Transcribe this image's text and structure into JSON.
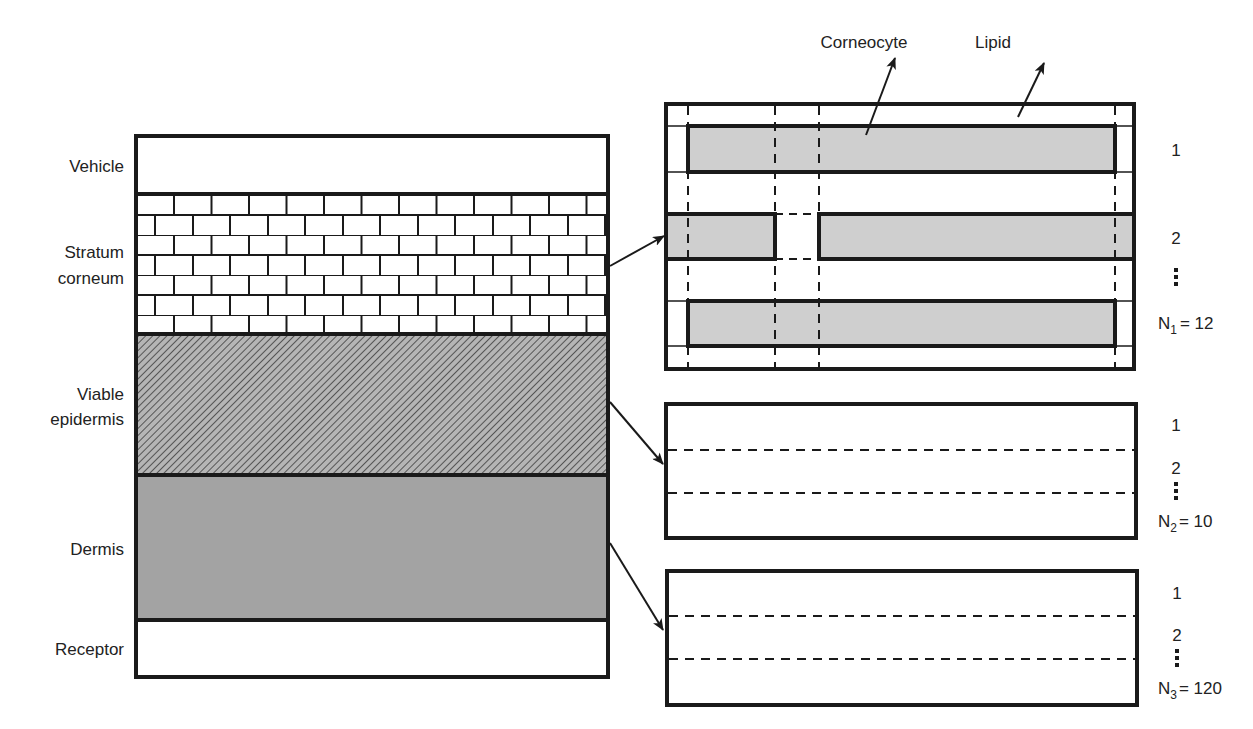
{
  "figure": {
    "type": "skin-layer-compartment-model",
    "colors": {
      "stroke": "#1a1a1a",
      "corneocyte_fill": "#cfcfcf",
      "viable_epidermis_fill": "#9a9a9a",
      "dermis_fill": "#a3a3a3",
      "background": "#ffffff"
    }
  },
  "left_stack": {
    "layers": [
      {
        "id": "vehicle",
        "label_lines": [
          "Vehicle"
        ],
        "pattern": "blank"
      },
      {
        "id": "stratum-corneum",
        "label_lines": [
          "Stratum",
          "corneum"
        ],
        "pattern": "brick"
      },
      {
        "id": "viable-epidermis",
        "label_lines": [
          "Viable",
          "epidermis"
        ],
        "pattern": "diagonal-hatch"
      },
      {
        "id": "dermis",
        "label_lines": [
          "Dermis"
        ],
        "pattern": "solid-gray"
      },
      {
        "id": "receptor",
        "label_lines": [
          "Receptor"
        ],
        "pattern": "blank"
      }
    ]
  },
  "callouts": {
    "corneocyte": "Corneocyte",
    "lipid": "Lipid"
  },
  "panels": {
    "stratum_corneum": {
      "row_labels": [
        "1",
        "2",
        "⋮"
      ],
      "count_label": {
        "prefix": "N",
        "subscript": "1",
        "value": "= 12"
      }
    },
    "viable_epidermis": {
      "row_labels": [
        "1",
        "2",
        "⋮"
      ],
      "count_label": {
        "prefix": "N",
        "subscript": "2",
        "value": "= 10"
      }
    },
    "dermis": {
      "row_labels": [
        "1",
        "2",
        "⋮"
      ],
      "count_label": {
        "prefix": "N",
        "subscript": "3",
        "value": "= 120"
      }
    }
  }
}
